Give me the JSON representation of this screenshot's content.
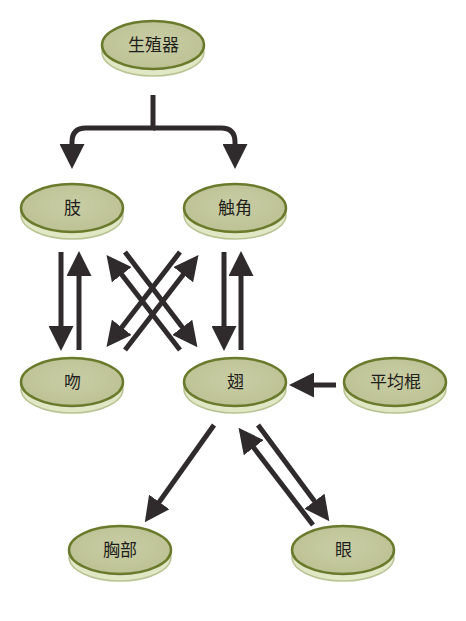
{
  "colors": {
    "face": "#c4c89d",
    "face_border": "#6a7a2c",
    "rim": "#e0e7c5",
    "rim_border": "#b9c394",
    "arrow": "#2f2b2d"
  },
  "nodes": [
    {
      "id": "genitalia",
      "label": "生殖器",
      "cx": 153,
      "cy": 45
    },
    {
      "id": "limb",
      "label": "肢",
      "cx": 72,
      "cy": 208
    },
    {
      "id": "antenna",
      "label": "触角",
      "cx": 235,
      "cy": 208
    },
    {
      "id": "proboscis",
      "label": "吻",
      "cx": 72,
      "cy": 382
    },
    {
      "id": "wing",
      "label": "翅",
      "cx": 235,
      "cy": 382
    },
    {
      "id": "haltere",
      "label": "平均棍",
      "cx": 395,
      "cy": 382
    },
    {
      "id": "thorax",
      "label": "胸部",
      "cx": 120,
      "cy": 550
    },
    {
      "id": "eye",
      "label": "眼",
      "cx": 343,
      "cy": 550
    }
  ],
  "edges": [
    {
      "from": "genitalia",
      "to": "limb",
      "type": "branch"
    },
    {
      "from": "genitalia",
      "to": "antenna",
      "type": "branch"
    },
    {
      "from": "limb",
      "to": "proboscis"
    },
    {
      "from": "proboscis",
      "to": "limb"
    },
    {
      "from": "limb",
      "to": "wing"
    },
    {
      "from": "wing",
      "to": "limb"
    },
    {
      "from": "antenna",
      "to": "proboscis"
    },
    {
      "from": "proboscis",
      "to": "antenna"
    },
    {
      "from": "antenna",
      "to": "wing"
    },
    {
      "from": "wing",
      "to": "antenna"
    },
    {
      "from": "haltere",
      "to": "wing"
    },
    {
      "from": "wing",
      "to": "thorax"
    },
    {
      "from": "wing",
      "to": "eye"
    },
    {
      "from": "eye",
      "to": "wing"
    }
  ]
}
